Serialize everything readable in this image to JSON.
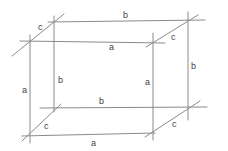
{
  "diagram": {
    "type": "hand-drawn cuboid sketch",
    "stroke_color": "#8a8a8a",
    "label_color": "#444444",
    "labels": [
      {
        "id": "back-top",
        "text": "b"
      },
      {
        "id": "top-left-depth",
        "text": "c"
      },
      {
        "id": "front-top",
        "text": "a"
      },
      {
        "id": "top-right-depth",
        "text": "c"
      },
      {
        "id": "back-left-vertical",
        "text": "b"
      },
      {
        "id": "front-left-vertical",
        "text": "a"
      },
      {
        "id": "front-right-vertical",
        "text": "a"
      },
      {
        "id": "back-right-vertical",
        "text": "b"
      },
      {
        "id": "back-bottom",
        "text": "b"
      },
      {
        "id": "bottom-left-depth",
        "text": "c"
      },
      {
        "id": "front-bottom",
        "text": "a"
      },
      {
        "id": "bottom-right-depth",
        "text": "c"
      }
    ]
  }
}
